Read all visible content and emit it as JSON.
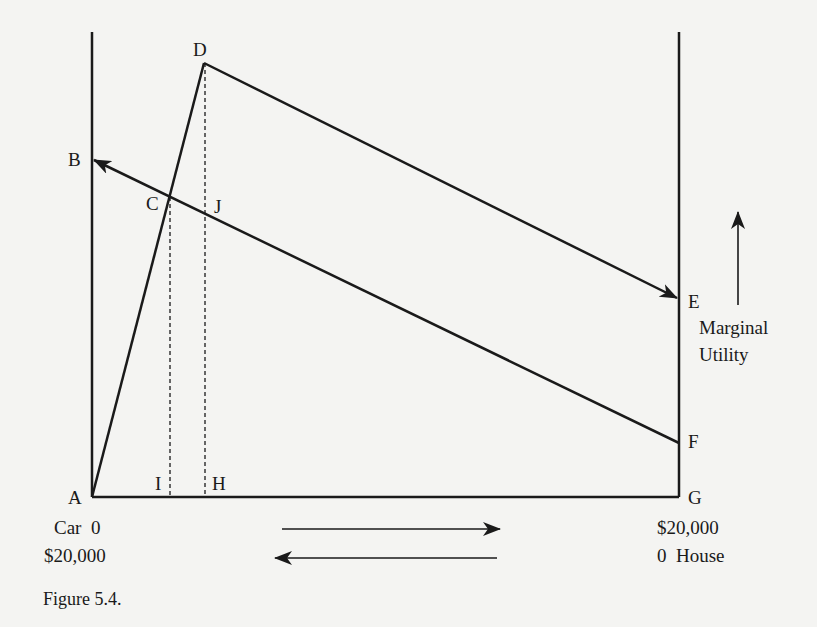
{
  "figure": {
    "caption": "Figure 5.4.",
    "points": {
      "A": "A",
      "B": "B",
      "C": "C",
      "D": "D",
      "E": "E",
      "F": "F",
      "G": "G",
      "H": "H",
      "I": "I",
      "J": "J"
    },
    "left_axis": {
      "line1": "Car  0",
      "line2": "$20,000"
    },
    "right_axis": {
      "line1": "$20,000",
      "line2": "0  House"
    },
    "y_label": {
      "line1": "Marginal",
      "line2": "Utility"
    },
    "colors": {
      "background": "#f4f4f2",
      "ink": "#1a1a1a"
    }
  }
}
